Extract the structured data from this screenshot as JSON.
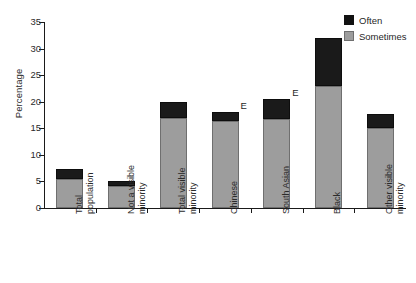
{
  "chart_data": {
    "type": "bar",
    "subtype": "stacked-vertical",
    "title": "",
    "xlabel": "",
    "ylabel": "Percentage",
    "ylim": [
      0,
      35
    ],
    "yticks": [
      0,
      5,
      10,
      15,
      20,
      25,
      30,
      35
    ],
    "grid": false,
    "legend_position": "top-right",
    "categories": [
      "Total population",
      "Not a visible minority",
      "Total visible minority",
      "Chinese",
      "South Asian",
      "Black",
      "Other visible minority"
    ],
    "category_lines": [
      [
        "Total",
        "population"
      ],
      [
        "Not a visible",
        "minority"
      ],
      [
        "Total visible",
        "minority"
      ],
      [
        "Chinese",
        ""
      ],
      [
        "South Asian",
        ""
      ],
      [
        "Black",
        ""
      ],
      [
        "Other visible",
        "minority"
      ]
    ],
    "series": [
      {
        "name": "Sometimes",
        "color": "#9d9d9d",
        "values": [
          5.4,
          4.1,
          17.0,
          16.3,
          16.8,
          23.0,
          15.0
        ]
      },
      {
        "name": "Often",
        "color": "#1a1a1a",
        "values": [
          1.9,
          1.0,
          3.0,
          1.7,
          3.8,
          9.0,
          2.7
        ]
      }
    ],
    "totals": [
      7.3,
      5.1,
      20.0,
      18.0,
      20.6,
      32.0,
      17.7
    ],
    "annotations": [
      {
        "text": "E",
        "category": "Chinese"
      },
      {
        "text": "E",
        "category": "South Asian"
      }
    ]
  },
  "legend": {
    "items": [
      {
        "label": "Often",
        "color": "#1a1a1a"
      },
      {
        "label": "Sometimes",
        "color": "#9d9d9d"
      }
    ]
  },
  "axis": {
    "y_label": "Percentage",
    "y_tick_labels": [
      "0",
      "5",
      "10",
      "15",
      "20",
      "25",
      "30",
      "35"
    ]
  }
}
